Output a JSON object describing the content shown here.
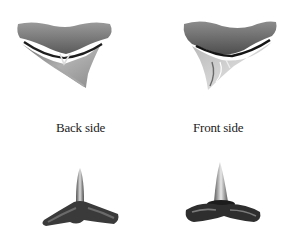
{
  "figure": {
    "panels": [
      {
        "id": "back-lateral",
        "view": "back side, lateral tooth"
      },
      {
        "id": "front-lateral",
        "view": "front side, lateral tooth"
      },
      {
        "id": "back-anterior",
        "view": "back side, anterior tooth"
      },
      {
        "id": "front-anterior",
        "view": "front side, anterior tooth"
      }
    ],
    "labels": {
      "back": "Back side",
      "front": "Front side"
    },
    "colors": {
      "background": "#ffffff",
      "text": "#222222",
      "tooth_dark": "#2a2a2a",
      "tooth_mid": "#7a7a7a",
      "tooth_light": "#c8c8c8"
    }
  }
}
